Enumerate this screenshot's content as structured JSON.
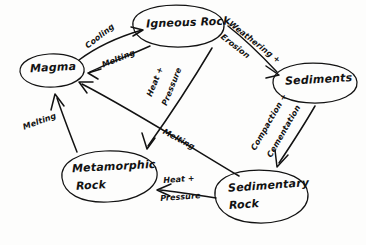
{
  "diagram": {
    "style": "hand-drawn sketch",
    "ink_color": "#121212",
    "background_color": "#fdfdfc",
    "nodes": [
      {
        "id": "magma",
        "label": "Magma",
        "shape": "ellipse"
      },
      {
        "id": "igneous",
        "label": "Igneous Rock",
        "shape": "ellipse"
      },
      {
        "id": "sediments",
        "label": "Sediments",
        "shape": "ellipse"
      },
      {
        "id": "sedimentary",
        "label_line1": "Sedimentary",
        "label_line2": "Rock",
        "shape": "ellipse"
      },
      {
        "id": "metamorphic",
        "label_line1": "Metamorphic",
        "label_line2": "Rock",
        "shape": "ellipse"
      }
    ],
    "edges": [
      {
        "id": "magma-to-igneous",
        "from": "Magma",
        "to": "Igneous Rock",
        "label": "Cooling"
      },
      {
        "id": "igneous-to-magma",
        "from": "Igneous Rock",
        "to": "Magma",
        "label": "Melting"
      },
      {
        "id": "igneous-to-sediments",
        "from": "Igneous Rock",
        "to": "Sediments",
        "label_line1": "Weathering +",
        "label_line2": "Erosion"
      },
      {
        "id": "igneous-to-metamorphic",
        "from": "Igneous Rock",
        "to": "Metamorphic Rock",
        "label_line1": "Heat +",
        "label_line2": "Pressure"
      },
      {
        "id": "sediments-to-sedimentary",
        "from": "Sediments",
        "to": "Sedimentary Rock",
        "label_line1": "Compaction +",
        "label_line2": "Cementation"
      },
      {
        "id": "sedimentary-to-metamorphic",
        "from": "Sedimentary Rock",
        "to": "Metamorphic Rock",
        "label_line1": "Heat +",
        "label_line2": "Pressure"
      },
      {
        "id": "sedimentary-to-magma",
        "from": "Sedimentary Rock",
        "to": "Magma",
        "label": "Melting"
      },
      {
        "id": "metamorphic-to-magma",
        "from": "Metamorphic Rock",
        "to": "Magma",
        "label": "Melting"
      }
    ]
  }
}
